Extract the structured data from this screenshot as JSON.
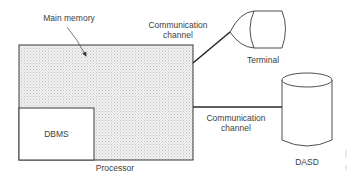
{
  "diagram": {
    "labels": {
      "main_memory": "Main memory",
      "channel_top_line1": "Communication",
      "channel_top_line2": "channel",
      "terminal": "Terminal",
      "channel_bottom_line1": "Communication",
      "channel_bottom_line2": "channel",
      "dbms": "DBMS",
      "processor": "Processor",
      "dasd": "DASD"
    },
    "nodes": [
      {
        "id": "processor",
        "label": "Processor",
        "shape": "rectangle",
        "fill": "stippled"
      },
      {
        "id": "main-memory",
        "label": "Main memory",
        "shape": "region",
        "pointer": "arrow"
      },
      {
        "id": "dbms",
        "label": "DBMS",
        "shape": "rectangle"
      },
      {
        "id": "terminal",
        "label": "Terminal",
        "shape": "display"
      },
      {
        "id": "dasd",
        "label": "DASD",
        "shape": "cylinder"
      }
    ],
    "edges": [
      {
        "from": "processor",
        "to": "terminal",
        "label": "Communication channel"
      },
      {
        "from": "processor",
        "to": "dasd",
        "label": "Communication channel"
      }
    ],
    "colors": {
      "stroke": "#3a3a3a",
      "stipple": "#d9d9d9"
    }
  }
}
